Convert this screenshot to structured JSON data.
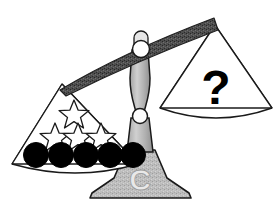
{
  "figure": {
    "name": "balance-scale-puzzle",
    "background_color": "#ffffff",
    "tilt": "left-side-down"
  },
  "colors": {
    "outline": "#1a1a1a",
    "beam_fill": "#4a4a4a",
    "beam_highlight": "#6e6e6e",
    "pillar_fill": "#b5b5b5",
    "pillar_shade": "#9e9e9e",
    "base_fill": "#b5b5b5",
    "pan_fill": "#ffffff",
    "circle_fill": "#000000",
    "star_fill": "#ffffff",
    "question_color": "#000000",
    "pivot_fill": "#ffffff",
    "monogram_color": "#e8e8e8"
  },
  "beam": {
    "name": "balance-beam",
    "left_end": {
      "x": 62,
      "y": 83
    },
    "right_end": {
      "x": 215,
      "y": 24
    },
    "thickness": 13
  },
  "pivot": {
    "name": "pivot-hinge",
    "cx": 140,
    "cy": 48,
    "r": 8
  },
  "pillar": {
    "name": "center-pillar",
    "joint": {
      "cx": 140,
      "cy": 116,
      "r": 7
    }
  },
  "base": {
    "name": "scale-base",
    "monogram": "C"
  },
  "left_pan": {
    "name": "left-pan",
    "label": "Left pan",
    "apex": {
      "x": 62,
      "y": 83
    },
    "contents": {
      "stars": {
        "name": "star-items",
        "count": 4,
        "fill": "#ffffff",
        "rows": [
          {
            "row": 1,
            "count": 1,
            "positions": [
              {
                "cx": 74,
                "cy": 113,
                "r": 13
              }
            ]
          },
          {
            "row": 2,
            "count": 3,
            "positions": [
              {
                "cx": 55,
                "cy": 136,
                "r": 13
              },
              {
                "cx": 77,
                "cy": 136,
                "r": 13
              },
              {
                "cx": 99,
                "cy": 136,
                "r": 13
              }
            ]
          }
        ]
      },
      "circles": {
        "name": "circle-items",
        "count": 5,
        "fill": "#000000",
        "positions": [
          {
            "cx": 36,
            "cy": 155,
            "r": 12
          },
          {
            "cx": 62,
            "cy": 155,
            "r": 12
          },
          {
            "cx": 88,
            "cy": 155,
            "r": 12
          },
          {
            "cx": 112,
            "cy": 155,
            "r": 12
          },
          {
            "cx": 136,
            "cy": 155,
            "r": 12
          }
        ]
      }
    }
  },
  "right_pan": {
    "name": "right-pan",
    "label": "Right pan",
    "apex": {
      "x": 215,
      "y": 24
    },
    "contents": {
      "unknown": {
        "name": "question-mark-item",
        "symbol": "?",
        "x": 216,
        "y": 92,
        "font_size": 46
      }
    }
  }
}
